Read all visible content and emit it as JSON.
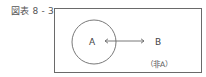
{
  "figure": {
    "caption": "図表 8 - 3",
    "labels": {
      "set_a": "A",
      "set_b": "B",
      "complement": "（非A）"
    },
    "elements": {
      "frame": "universe-rectangle",
      "circle": "set-A-circle",
      "arrow": "double-headed-arrow A↔B"
    },
    "colors": {
      "line": "#6a6a6a",
      "text": "#444444",
      "background": "#ffffff"
    }
  }
}
